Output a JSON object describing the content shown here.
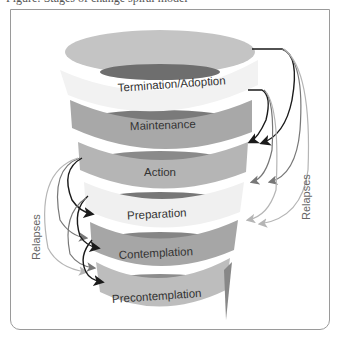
{
  "figure": {
    "caption_partial": "Figure: Stages of change spiral model",
    "stages": [
      {
        "label": "Termination/Adoption",
        "color": "#f1f1f1",
        "back_color": "#c6c6c6"
      },
      {
        "label": "Maintenance",
        "color": "#a9a9a9",
        "back_color": "#7d7d7d"
      },
      {
        "label": "Action",
        "color": "#b4b4b4",
        "back_color": "#8a8a8a"
      },
      {
        "label": "Preparation",
        "color": "#efefef",
        "back_color": "#7a7a7a"
      },
      {
        "label": "Contemplation",
        "color": "#a5a5a5",
        "back_color": "#858585"
      },
      {
        "label": "Precontemplation",
        "color": "#bdbdbd",
        "back_color": "#8f8f8f"
      }
    ],
    "relapse_labels": {
      "left": "Relapses",
      "right": "Relapses"
    },
    "arrow_colors": {
      "dark": "#1a1a1a",
      "mid": "#777777",
      "light": "#b5b5b5"
    }
  }
}
